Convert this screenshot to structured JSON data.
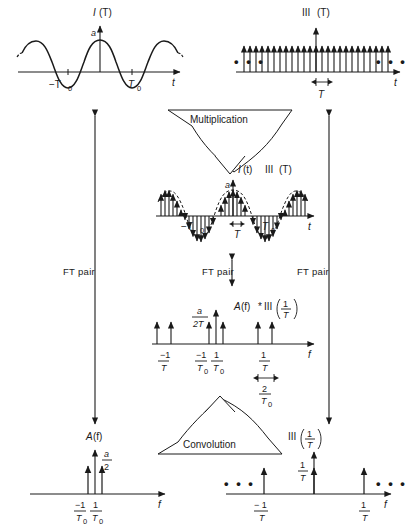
{
  "figure": {
    "stroke_color": "#1a1a1a",
    "background": "#ffffff"
  },
  "flow": {
    "multiplication_label": "Multiplication",
    "convolution_label": "Convolution",
    "ft_pair_label_left": "FT  pair",
    "ft_pair_label_middle": "FT pair",
    "ft_pair_label_right": "FT  pair",
    "product_label_I": "I",
    "product_label_t": "(t)",
    "product_label_shah": "III",
    "product_label_T": "(T)"
  },
  "panels": {
    "top_left": {
      "name": "cosine-signal",
      "title_fn": "I",
      "title_arg": "(T)",
      "amplitude_label": "a",
      "x_axis_label": "t",
      "tick_neg": "−T",
      "tick_neg_sub": "0",
      "tick_pos": "T",
      "tick_pos_sub": "0",
      "period": "T0",
      "waveform": "cosine"
    },
    "top_right": {
      "name": "shah-comb-time",
      "title_fn": "III",
      "title_arg": "(T)",
      "x_axis_label": "t",
      "spacing_label": "T",
      "ellipsis": "• • •",
      "n_teeth": 25
    },
    "middle": {
      "name": "sampled-cosine",
      "amplitude_label": "a",
      "x_axis_label": "t",
      "tick_neg": "−T",
      "tick_neg_sub": "0",
      "tick_pos": "T",
      "tick_pos_sub": "0",
      "spacing_label": "T"
    },
    "spectrum": {
      "name": "replicated-spectrum",
      "title_main": "A",
      "title_f": "(f)",
      "title_star": "*",
      "title_shah": "III",
      "title_num": "1",
      "title_den": "T",
      "amp_num": "a",
      "amp_den": "2T",
      "x_axis_label": "f",
      "tick_negT_num": "−1",
      "tick_negT_den": "T",
      "tick_negT0_num": "−1",
      "tick_negT0_den": "T",
      "tick_negT0_sub": "0",
      "tick_posT0_num": "1",
      "tick_posT0_den": "T",
      "tick_posT0_sub": "0",
      "tick_posT_num": "1",
      "tick_posT_den": "T",
      "span_num": "2",
      "span_den": "T",
      "span_sub": "0"
    },
    "bottom_left": {
      "name": "spectrum-A-f",
      "title_fn": "A",
      "title_arg": "(f)",
      "amp_num": "a",
      "amp_den": "2",
      "x_axis_label": "f",
      "tick_neg_num": "−1",
      "tick_neg_den": "T",
      "tick_neg_sub": "0",
      "tick_pos_num": "1",
      "tick_pos_den": "T",
      "tick_pos_sub": "0"
    },
    "bottom_right": {
      "name": "shah-comb-freq",
      "title_fn": "III",
      "title_num": "1",
      "title_den": "T",
      "amp_num": "1",
      "amp_den": "T",
      "x_axis_label": "f",
      "tick_neg_num": "− 1",
      "tick_neg_den": "T",
      "tick_pos_num": "1",
      "tick_pos_den": "T",
      "ellipsis": "• • •"
    }
  },
  "chart_data": {
    "type": "line",
    "panels": [
      {
        "id": "top_left",
        "type": "line",
        "title": "I(T)",
        "xlabel": "t",
        "description": "Continuous cosine of amplitude a and period T0",
        "amplitude": 1.0,
        "period": "T0",
        "x_ticks": [
          "-T0",
          "T0"
        ]
      },
      {
        "id": "top_right",
        "type": "bar",
        "title": "III(T)",
        "xlabel": "t",
        "description": "Impulse train (shah function) with spacing T",
        "spacing": "T",
        "n_impulses": 25,
        "amplitude": 1.0
      },
      {
        "id": "middle",
        "type": "bar",
        "title": "I(t) III(T)",
        "xlabel": "t",
        "description": "Sampled cosine: impulses bounded by the cosine envelope",
        "amplitude": "a",
        "spacing": "T",
        "x_ticks": [
          "-T0",
          "T0"
        ]
      },
      {
        "id": "spectrum",
        "type": "bar",
        "title": "A(f)*III(1/T)",
        "xlabel": "f",
        "description": "Replicated spectrum: impulse pairs of height a/2T repeating every 1/T",
        "amplitude": "a/2T",
        "x_ticks": [
          "-1/T",
          "-1/T0",
          "1/T0",
          "1/T"
        ],
        "pair_separation": "2/T0"
      },
      {
        "id": "bottom_left",
        "type": "bar",
        "title": "A(f)",
        "xlabel": "f",
        "description": "Two impulses of height a/2 at plus and minus 1/T0",
        "amplitude": "a/2",
        "x_ticks": [
          "-1/T0",
          "1/T0"
        ]
      },
      {
        "id": "bottom_right",
        "type": "bar",
        "title": "III(1/T)",
        "xlabel": "f",
        "description": "Frequency-domain impulse train of height 1/T spaced 1/T apart",
        "amplitude": "1/T",
        "x_ticks": [
          "-1/T",
          "1/T"
        ]
      }
    ]
  }
}
